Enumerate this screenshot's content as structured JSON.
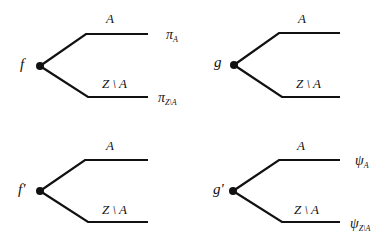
{
  "diagram": {
    "trees": [
      {
        "id": "f",
        "node_label": "f",
        "upper_branch_label": "A",
        "lower_branch_label": "Z \\ A",
        "upper_payoff": {
          "symbol": "π",
          "subscript": "A"
        },
        "lower_payoff": {
          "symbol": "π",
          "subscript": "Z\\A"
        }
      },
      {
        "id": "g",
        "node_label": "g",
        "upper_branch_label": "A",
        "lower_branch_label": "Z \\ A",
        "upper_payoff": null,
        "lower_payoff": null
      },
      {
        "id": "f-prime",
        "node_label": "f'",
        "upper_branch_label": "A",
        "lower_branch_label": "Z \\ A",
        "upper_payoff": null,
        "lower_payoff": null
      },
      {
        "id": "g-prime",
        "node_label": "g'",
        "upper_branch_label": "A",
        "lower_branch_label": "Z \\ A",
        "upper_payoff": {
          "symbol": "ψ",
          "subscript": "A"
        },
        "lower_payoff": {
          "symbol": "ψ",
          "subscript": "Z\\A"
        }
      }
    ],
    "colors": {
      "line": "#111111",
      "background": "#ffffff"
    }
  }
}
